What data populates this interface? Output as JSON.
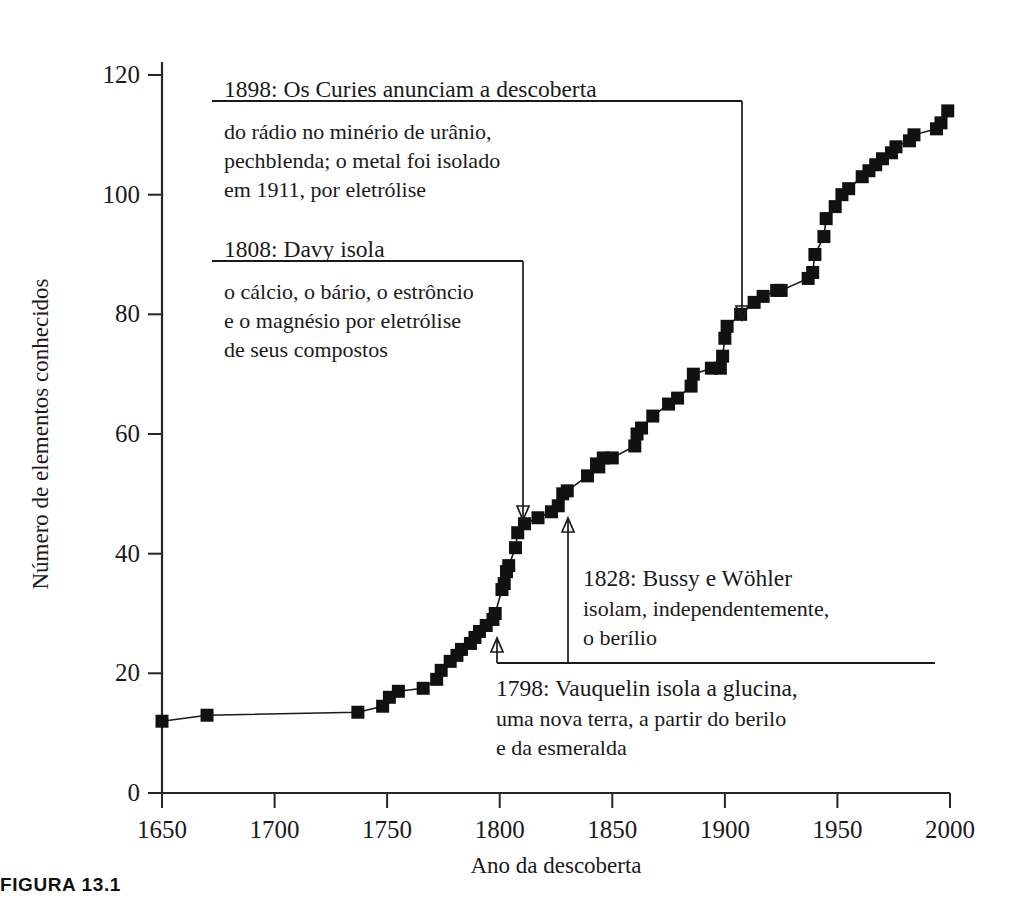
{
  "figure": {
    "caption": "FIGURA 13.1"
  },
  "chart_data": {
    "type": "scatter",
    "title": "",
    "xlabel": "Ano da descoberta",
    "ylabel": "Número de elementos conhecidos",
    "xlim": [
      1650,
      2000
    ],
    "ylim": [
      0,
      120
    ],
    "xticks": [
      "1650",
      "1700",
      "1750",
      "1800",
      "1850",
      "1900",
      "1950",
      "2000"
    ],
    "yticks": [
      "0",
      "20",
      "40",
      "60",
      "80",
      "100",
      "120"
    ],
    "grid": false,
    "legend": "none",
    "marker": "filled-square",
    "series": [
      {
        "name": "Elementos conhecidos",
        "x": [
          1650,
          1670,
          1737,
          1748,
          1751,
          1755,
          1766,
          1772,
          1774,
          1778,
          1781,
          1783,
          1787,
          1789,
          1791,
          1794,
          1797,
          1798,
          1801,
          1802,
          1803,
          1804,
          1807,
          1808,
          1811,
          1817,
          1823,
          1826,
          1828,
          1830,
          1839,
          1843,
          1844,
          1846,
          1850,
          1860,
          1861,
          1863,
          1868,
          1875,
          1879,
          1885,
          1886,
          1894,
          1898,
          1899,
          1900,
          1901,
          1907,
          1913,
          1917,
          1923,
          1925,
          1937,
          1939,
          1940,
          1944,
          1945,
          1949,
          1952,
          1955,
          1961,
          1964,
          1967,
          1970,
          1974,
          1976,
          1982,
          1984,
          1994,
          1996,
          1999
        ],
        "y": [
          12,
          13,
          13.5,
          14.5,
          16,
          17,
          17.5,
          19,
          20.5,
          22,
          23,
          24,
          25,
          26,
          27,
          28,
          29,
          30,
          34,
          35,
          37,
          38,
          41,
          43.5,
          45,
          46,
          47,
          48,
          50,
          50.5,
          53,
          55,
          54.5,
          56,
          56,
          58,
          60,
          61,
          63,
          65,
          66,
          68,
          70,
          71,
          71,
          73,
          76,
          78,
          80,
          82,
          83,
          84,
          84,
          86,
          87,
          90,
          93,
          96,
          98,
          100,
          101,
          103,
          104,
          105,
          106,
          107,
          108,
          109,
          110,
          111,
          112,
          114
        ]
      }
    ],
    "annotations": [
      {
        "id": "anno-1898",
        "head": "1898: Os Curies anunciam a descoberta",
        "body": [
          "do rádio no minério de urânio,",
          "pechblenda; o metal foi isolado",
          "em 1911, por eletrólise"
        ],
        "points_to_year": 1907,
        "points_to_value": 80
      },
      {
        "id": "anno-1808",
        "head": "1808: Davy isola",
        "body": [
          "o cálcio, o bário, o estrôncio",
          "e o magnésio por eletrólise",
          "de seus compostos"
        ],
        "points_to_year": 1810,
        "points_to_value": 44
      },
      {
        "id": "anno-1828",
        "head": "1828: Bussy e Wöhler",
        "body": [
          "isolam, independentemente,",
          "o berílio"
        ],
        "points_to_year": 1831,
        "points_to_value": 47
      },
      {
        "id": "anno-1798",
        "head": "1798: Vauquelin isola a glucina,",
        "body": [
          "uma nova terra, a partir do berilo",
          "e da esmeralda"
        ],
        "points_to_year": 1800,
        "points_to_value": 28
      }
    ]
  }
}
